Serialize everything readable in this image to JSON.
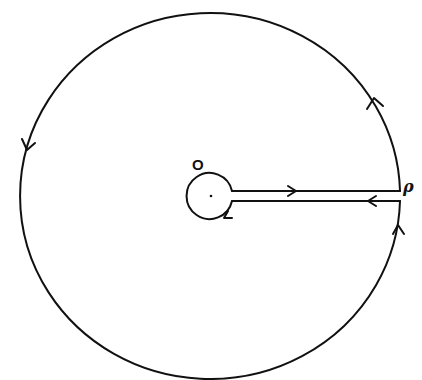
{
  "diagram": {
    "type": "contour-integration-keyhole",
    "labels": {
      "origin": "O",
      "point": "ρ"
    },
    "stroke_color": "#111111",
    "background": "#ffffff",
    "outer_circle": {
      "cx": 210,
      "cy": 196,
      "rx": 190,
      "ry": 183,
      "direction": "counterclockwise"
    },
    "inner_circle": {
      "cx": 211,
      "cy": 196,
      "r": 23,
      "direction": "clockwise"
    },
    "cut": {
      "upper_y": 191,
      "lower_y": 201,
      "x_start": 233,
      "x_end": 400
    },
    "arrows": [
      {
        "location": "outer-right-upper",
        "direction": "up"
      },
      {
        "location": "outer-left",
        "direction": "down"
      },
      {
        "location": "outer-right-lower",
        "direction": "up"
      },
      {
        "location": "cut-upper",
        "direction": "right"
      },
      {
        "location": "cut-lower",
        "direction": "left"
      },
      {
        "location": "inner-circle-bottom",
        "direction": "left"
      }
    ]
  }
}
